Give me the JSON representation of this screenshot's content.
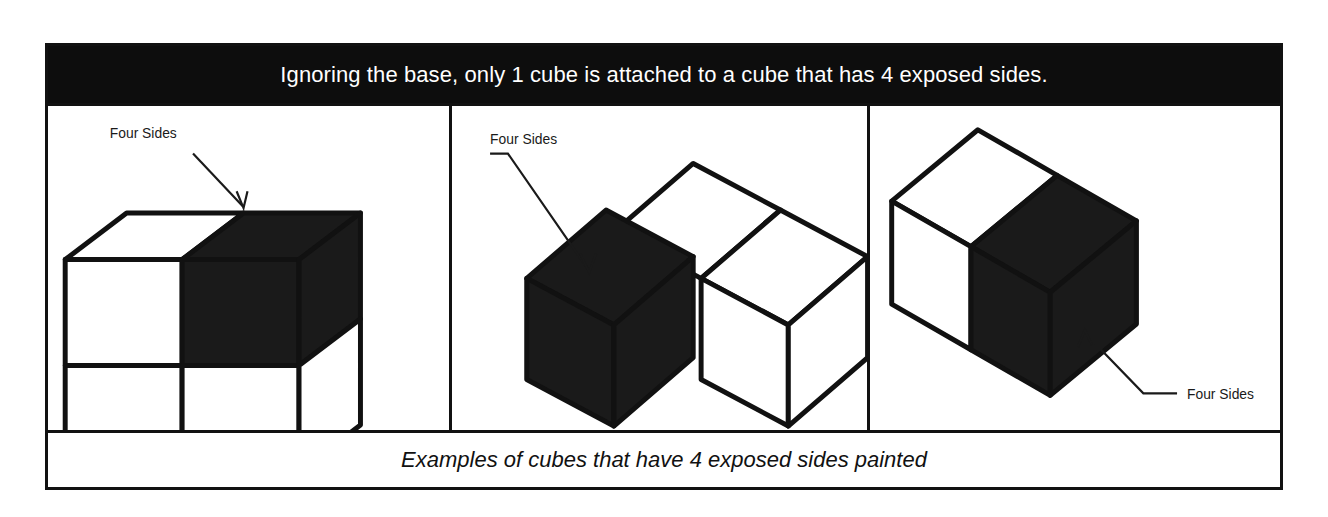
{
  "figure": {
    "header_statement": "Ignoring the base, only 1 cube is attached to a cube that has 4 exposed sides.",
    "caption": "Examples of cubes that have 4 exposed sides painted",
    "colors": {
      "border": "#111111",
      "header_background": "#0d0d0d",
      "header_text": "#ffffff",
      "shaded_cube_fill": "#1a1a1a",
      "plain_cube_fill": "#ffffff",
      "label_text": "#1a1a1a"
    },
    "panels": [
      {
        "id": "panel-1",
        "callout_label": "Four Sides",
        "description": "Two-by-two wall of four cubes with the upper-right cube painted"
      },
      {
        "id": "panel-2",
        "callout_label": "Four Sides",
        "description": "L-shaped group of three cubes with the left cube painted"
      },
      {
        "id": "panel-3",
        "callout_label": "Four Sides",
        "description": "Row of two cubes with the near cube painted"
      }
    ]
  }
}
